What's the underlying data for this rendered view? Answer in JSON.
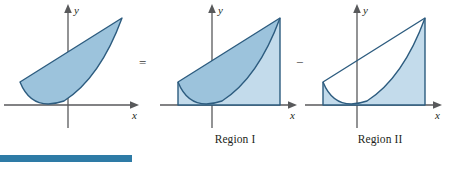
{
  "figure": {
    "equation_symbols": {
      "equals": "=",
      "minus": "−"
    },
    "axis_labels": {
      "x": "x",
      "y": "y"
    },
    "captions": {
      "region_1": "Region I",
      "region_2": "Region II"
    },
    "colors": {
      "fill_dark": "#9cc3dc",
      "fill_light": "#c3dbeb",
      "stroke_curve": "#2d5c7f",
      "axis": "#58595b",
      "accent_bar": "#2e7ba6",
      "caption_text": "#231f20",
      "operator_text": "#3a3a3a",
      "background": "#ffffff"
    },
    "panels": [
      {
        "name": "combined-region",
        "caption": "",
        "description": "Shaded lens-shaped region between the straight line and the parabola, from the left intersection to the right intersection.",
        "shading": "between-line-and-parabola"
      },
      {
        "name": "region-1",
        "caption": "Region I",
        "description": "Shaded area under the straight line down to the x-axis, bounded left and right by vertical segments at the intersection abscissas.",
        "shading": "under-line-to-x-axis"
      },
      {
        "name": "region-2",
        "caption": "Region II",
        "description": "Shaded area under the parabola down to the x-axis; the area between line and parabola is left unshaded (outlined only).",
        "shading": "under-parabola-to-x-axis"
      }
    ],
    "geometry": {
      "x_axis_y": 105,
      "y_axis_x_combined": 66,
      "y_axis_x_region1": 52,
      "y_axis_x_region2": 52,
      "left_bound_x": 18,
      "right_bound_x": 120,
      "apex_y": 18,
      "vertex_y": 100
    },
    "accent_bar": {
      "label": "accent-rule",
      "width_px": 132,
      "height_px": 7
    }
  }
}
